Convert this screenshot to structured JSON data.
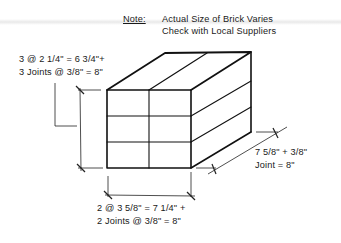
{
  "note": {
    "label": "Note:",
    "line1": "Actual Size of Brick Varies",
    "line2": "Check with Local Suppliers"
  },
  "dimensions": {
    "height": {
      "line1": "3 @ 2 1/4\" = 6 3/4\"+",
      "line2": "3 Joints @ 3/8\" = 8\""
    },
    "depth": {
      "line1": "7 5/8\" + 3/8\"",
      "line2": "Joint = 8\""
    },
    "width": {
      "line1": "2 @ 3 5/8\" = 7 1/4\" +",
      "line2": "2 Joints @ 3/8\" = 8\""
    }
  },
  "brick_module": {
    "courses": 3,
    "bricks_per_course_front": 2,
    "stroke_color": "#111111",
    "background_color": "#ffffff"
  }
}
